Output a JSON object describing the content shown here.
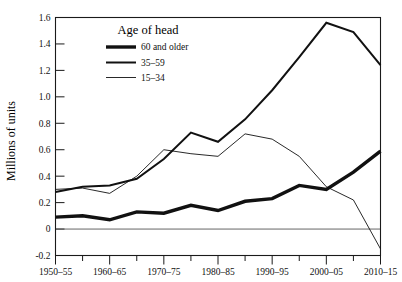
{
  "chart_data": {
    "type": "line",
    "title": "",
    "xlabel": "",
    "ylabel": "Millions of units",
    "ylim": [
      -0.2,
      1.6
    ],
    "yticks": [
      -0.2,
      0,
      0.2,
      0.4,
      0.6,
      0.8,
      1.0,
      1.2,
      1.4,
      1.6
    ],
    "ytick_labels": [
      "-0.2",
      "0",
      "0.2",
      "0.4",
      "0.6",
      "0.8",
      "1.0",
      "1.2",
      "1.4",
      "1.6"
    ],
    "categories": [
      "1950-55",
      "1955-60",
      "1960-65",
      "1965-70",
      "1970-75",
      "1975-80",
      "1980-85",
      "1985-90",
      "1990-95",
      "1995-2000",
      "2000-05",
      "2005-10",
      "2010-15"
    ],
    "xtick_labels": [
      "1950–55",
      "",
      "1960–65",
      "",
      "1970–75",
      "",
      "1980–85",
      "",
      "1990–95",
      "",
      "2000–05",
      "",
      "2010–15"
    ],
    "xtick_labels_visible": [
      "1950–55",
      "1960–65",
      "1970–75",
      "1980–85",
      "1990–95",
      "2000–05",
      "2010–15"
    ],
    "grid": false,
    "zero_line": true,
    "legend_position": "top-center",
    "legend_title": "Age of head",
    "series": [
      {
        "name": "60 and older",
        "style": "thick",
        "stroke_width": 3.4,
        "color": "#111111",
        "values": [
          0.09,
          0.1,
          0.07,
          0.13,
          0.12,
          0.18,
          0.14,
          0.21,
          0.23,
          0.33,
          0.3,
          0.43,
          0.59
        ]
      },
      {
        "name": "35–59",
        "style": "medium",
        "stroke_width": 2.0,
        "color": "#111111",
        "values": [
          0.28,
          0.32,
          0.33,
          0.38,
          0.53,
          0.73,
          0.66,
          0.83,
          1.05,
          1.3,
          1.56,
          1.49,
          1.24
        ]
      },
      {
        "name": "15–34",
        "style": "thin",
        "stroke_width": 0.9,
        "color": "#111111",
        "values": [
          0.3,
          0.31,
          0.27,
          0.4,
          0.6,
          0.57,
          0.55,
          0.72,
          0.68,
          0.55,
          0.32,
          0.22,
          -0.15
        ]
      }
    ]
  },
  "axis": {
    "y_title": "Millions of units"
  },
  "legend": {
    "title": "Age of head",
    "items": [
      {
        "label": "60 and older"
      },
      {
        "label": "35–59"
      },
      {
        "label": "15–34"
      }
    ]
  }
}
